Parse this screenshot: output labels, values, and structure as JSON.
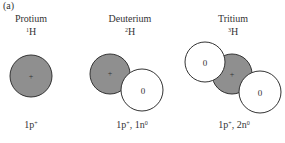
{
  "panel_label": "(a)",
  "isotopes": [
    {
      "name": "Protium",
      "mass_number": "1",
      "element": "H",
      "composition": {
        "p": "1p",
        "p_charge": "+",
        "n": "",
        "n_charge": ""
      }
    },
    {
      "name": "Deuterium",
      "mass_number": "2",
      "element": "H",
      "composition": {
        "p": "1p",
        "p_charge": "+",
        "n": ", 1n",
        "n_charge": "0"
      }
    },
    {
      "name": "Tritium",
      "mass_number": "3",
      "element": "H",
      "composition": {
        "p": "1p",
        "p_charge": "+",
        "n": ", 2n",
        "n_charge": "0"
      }
    }
  ],
  "particles": {
    "proton_symbol": "+",
    "neutron_symbol": "0"
  },
  "colors": {
    "proton_fill": "#8f8f8f",
    "neutron_fill": "#ffffff",
    "stroke": "#333333"
  }
}
